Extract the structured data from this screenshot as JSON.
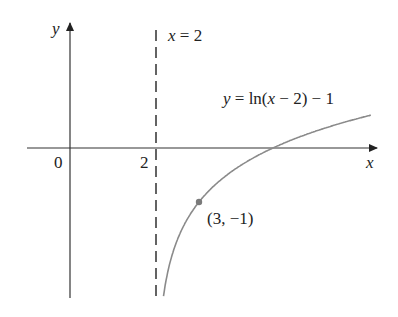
{
  "figure": {
    "x_axis_label": "x",
    "y_axis_label": "y",
    "origin_label": "0",
    "tick_label_2": "2",
    "asymptote_label": "x = 2",
    "asymptote_label_parts": {
      "var": "x",
      "rest": " = 2"
    },
    "curve_label_parts": {
      "y": "y",
      "eq": " = ln(",
      "x": "x",
      "rest": " − 2) − 1"
    },
    "curve_label": "y = ln(x − 2) − 1",
    "point_label": "(3, −1)",
    "colors": {
      "axis": "#222222",
      "curve": "#8a8a8a",
      "asymptote": "#222222",
      "point": "#7a7a7a"
    }
  },
  "chart_data": {
    "type": "line",
    "title": "",
    "function": "y = ln(x - 2) - 1",
    "asymptote": {
      "type": "vertical",
      "x": 2,
      "style": "dashed"
    },
    "marked_points": [
      {
        "x": 3,
        "y": -1,
        "label": "(3, −1)"
      }
    ],
    "x_intercept": 4.718,
    "xlabel": "x",
    "ylabel": "y",
    "ticks": {
      "x": [
        "0",
        "2"
      ]
    },
    "xlim": [
      -1,
      7.3
    ],
    "ylim": [
      -2.7,
      2.4
    ],
    "grid": false
  }
}
